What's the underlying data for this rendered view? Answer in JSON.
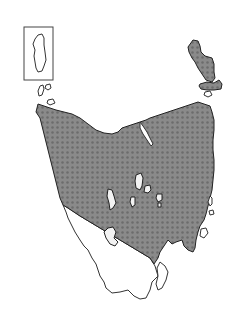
{
  "map": {
    "region": "Tasmania",
    "inset": {
      "label": "Macquarie Island inset"
    },
    "legend": {
      "shaded_color": "#7d7d7d",
      "unshaded_color": "#ffffff",
      "outline_color": "#333333"
    }
  }
}
